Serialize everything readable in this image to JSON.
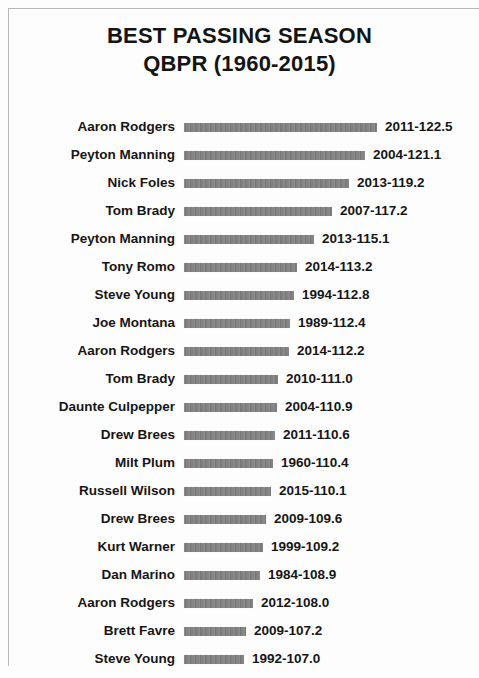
{
  "title": {
    "line1": "BEST PASSING SEASON",
    "line2": "QBPR (1960-2015)"
  },
  "colors": {
    "bar": "#7b7b7b",
    "text": "#161616",
    "background": "#fdfdfd",
    "border": "#b9b9b9"
  },
  "chart_data": {
    "type": "bar",
    "title": "BEST PASSING SEASON QBPR (1960-2015)",
    "xlabel": "",
    "ylabel": "",
    "orientation": "horizontal",
    "grid": false,
    "legend": false,
    "baseline": 100.0,
    "xlim": [
      100.0,
      123.0
    ],
    "categories": [
      "Aaron Rodgers",
      "Peyton Manning",
      "Nick Foles",
      "Tom Brady",
      "Peyton Manning",
      "Tony Romo",
      "Steve Young",
      "Joe Montana",
      "Aaron Rodgers",
      "Tom Brady",
      "Daunte Culpepper",
      "Drew Brees",
      "Milt Plum",
      "Russell Wilson",
      "Drew Brees",
      "Kurt Warner",
      "Dan Marino",
      "Aaron Rodgers",
      "Brett Favre",
      "Steve Young"
    ],
    "values": [
      122.5,
      121.1,
      119.2,
      117.2,
      115.1,
      113.2,
      112.8,
      112.4,
      112.2,
      111.0,
      110.9,
      110.6,
      110.4,
      110.1,
      109.6,
      109.2,
      108.9,
      108.0,
      107.2,
      107.0
    ],
    "years": [
      "2011",
      "2004",
      "2013",
      "2007",
      "2013",
      "2014",
      "1994",
      "1989",
      "2014",
      "2010",
      "2004",
      "2011",
      "1960",
      "2015",
      "2009",
      "1999",
      "1984",
      "2012",
      "2009",
      "1992"
    ],
    "data_labels": [
      "2011-122.5",
      "2004-121.1",
      "2013-119.2",
      "2007-117.2",
      "2013-115.1",
      "2014-113.2",
      "1994-112.8",
      "1989-112.4",
      "2014-112.2",
      "2010-111.0",
      "2004-110.9",
      "2011-110.6",
      "1960-110.4",
      "2015-110.1",
      "2009-109.6",
      "1999-109.2",
      "1984-108.9",
      "2012-108.0",
      "2009-107.2",
      "1992-107.0"
    ]
  },
  "rows": [
    {
      "name": "Aaron Rodgers",
      "value": 122.5,
      "label": "2011-122.5"
    },
    {
      "name": "Peyton Manning",
      "value": 121.1,
      "label": "2004-121.1"
    },
    {
      "name": "Nick Foles",
      "value": 119.2,
      "label": "2013-119.2"
    },
    {
      "name": "Tom Brady",
      "value": 117.2,
      "label": "2007-117.2"
    },
    {
      "name": "Peyton Manning",
      "value": 115.1,
      "label": "2013-115.1"
    },
    {
      "name": "Tony Romo",
      "value": 113.2,
      "label": "2014-113.2"
    },
    {
      "name": "Steve Young",
      "value": 112.8,
      "label": "1994-112.8"
    },
    {
      "name": "Joe Montana",
      "value": 112.4,
      "label": "1989-112.4"
    },
    {
      "name": "Aaron Rodgers",
      "value": 112.2,
      "label": "2014-112.2"
    },
    {
      "name": "Tom Brady",
      "value": 111.0,
      "label": "2010-111.0"
    },
    {
      "name": "Daunte Culpepper",
      "value": 110.9,
      "label": "2004-110.9"
    },
    {
      "name": "Drew Brees",
      "value": 110.6,
      "label": "2011-110.6"
    },
    {
      "name": "Milt Plum",
      "value": 110.4,
      "label": "1960-110.4"
    },
    {
      "name": "Russell Wilson",
      "value": 110.1,
      "label": "2015-110.1"
    },
    {
      "name": "Drew Brees",
      "value": 109.6,
      "label": "2009-109.6"
    },
    {
      "name": "Kurt Warner",
      "value": 109.2,
      "label": "1999-109.2"
    },
    {
      "name": "Dan Marino",
      "value": 108.9,
      "label": "1984-108.9"
    },
    {
      "name": "Aaron Rodgers",
      "value": 108.0,
      "label": "2012-108.0"
    },
    {
      "name": "Brett Favre",
      "value": 107.2,
      "label": "2009-107.2"
    },
    {
      "name": "Steve Young",
      "value": 107.0,
      "label": "1992-107.0"
    }
  ]
}
